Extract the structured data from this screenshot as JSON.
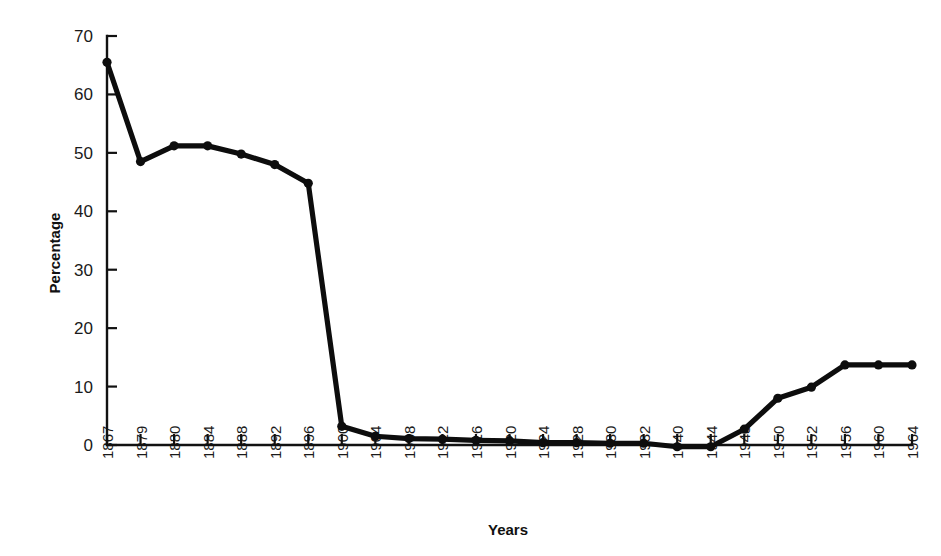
{
  "chart_data": {
    "type": "line",
    "title": "",
    "xlabel": "Years",
    "ylabel": "Percentage",
    "categories": [
      "1867",
      "1879",
      "1880",
      "1884",
      "1888",
      "1892",
      "1896",
      "1900",
      "1904",
      "1908",
      "1912",
      "1916",
      "1920",
      "1924",
      "1928",
      "1930",
      "1932",
      "1940",
      "1944",
      "1948",
      "1950",
      "1952",
      "1956",
      "1960",
      "1964"
    ],
    "values": [
      65.5,
      48.5,
      51.2,
      51.2,
      49.8,
      48.0,
      44.8,
      3.2,
      1.5,
      1.1,
      1.0,
      0.8,
      0.7,
      0.4,
      0.4,
      0.3,
      0.3,
      -0.3,
      -0.3,
      2.7,
      8.0,
      9.9,
      13.7,
      13.7,
      13.7
    ],
    "series": [
      {
        "name": "Percentage",
        "values": [
          65.5,
          48.5,
          51.2,
          51.2,
          49.8,
          48.0,
          44.8,
          3.2,
          1.5,
          1.1,
          1.0,
          0.8,
          0.7,
          0.4,
          0.4,
          0.3,
          0.3,
          -0.3,
          -0.3,
          2.7,
          8.0,
          9.9,
          13.7,
          13.7,
          13.7
        ],
        "color": "#0d0d0d",
        "marker": "circle"
      }
    ],
    "ylim": [
      0,
      70
    ],
    "yticks": [
      0,
      10,
      20,
      30,
      40,
      50,
      60,
      70
    ],
    "ytick_labels": [
      "0",
      "10",
      "20",
      "30",
      "40",
      "50",
      "60",
      "70"
    ],
    "grid": false,
    "legend": false,
    "legend_position": "none"
  },
  "axes": {
    "y_title": "Percentage",
    "x_title": "Years"
  },
  "style": {
    "line_color": "#0d0d0d",
    "axis_color": "#111111",
    "background": "#ffffff"
  }
}
